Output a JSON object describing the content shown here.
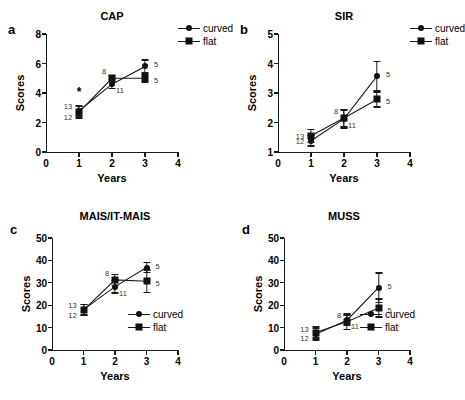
{
  "figure": {
    "legend": {
      "curved": "curved",
      "flat": "flat"
    },
    "axis": {
      "xlabel": "Years",
      "ylabel": "Scores"
    }
  },
  "chart_data": [
    {
      "type": "line",
      "panel": "a",
      "title": "CAP",
      "xlabel": "Years",
      "ylabel": "Scores",
      "x": [
        1,
        2,
        3
      ],
      "xlim": [
        0,
        4
      ],
      "xticks": [
        0,
        1,
        2,
        3,
        4
      ],
      "ylim": [
        0,
        8
      ],
      "yticks": [
        0,
        2,
        4,
        6,
        8
      ],
      "grid": false,
      "legend_position": "top-right-outside",
      "series": [
        {
          "name": "curved",
          "marker": "circle",
          "values": [
            2.8,
            4.6,
            5.8
          ],
          "errors": [
            0.35,
            0.3,
            0.45
          ],
          "n": [
            13,
            11,
            5
          ]
        },
        {
          "name": "flat",
          "marker": "square",
          "values": [
            2.7,
            5.0,
            5.0
          ],
          "errors": [
            0.4,
            0.2,
            0.25
          ],
          "n": [
            12,
            8,
            5
          ]
        }
      ],
      "annotations": [
        {
          "text": "*",
          "x": 1,
          "y": 4.1
        }
      ]
    },
    {
      "type": "line",
      "panel": "b",
      "title": "SIR",
      "xlabel": "Years",
      "ylabel": "Scores",
      "x": [
        1,
        2,
        3
      ],
      "xlim": [
        0,
        4
      ],
      "xticks": [
        0,
        1,
        2,
        3,
        4
      ],
      "ylim": [
        1,
        5
      ],
      "yticks": [
        1,
        2,
        3,
        4,
        5
      ],
      "grid": false,
      "legend_position": "top-right-outside",
      "series": [
        {
          "name": "curved",
          "marker": "circle",
          "values": [
            1.38,
            2.12,
            3.57
          ],
          "errors": [
            0.18,
            0.3,
            0.5
          ],
          "n": [
            13,
            11,
            5
          ]
        },
        {
          "name": "flat",
          "marker": "square",
          "values": [
            1.55,
            2.15,
            2.78
          ],
          "errors": [
            0.22,
            0.3,
            0.25
          ],
          "n": [
            12,
            8,
            5
          ]
        }
      ],
      "annotations": []
    },
    {
      "type": "line",
      "panel": "c",
      "title": "MAIS/IT-MAIS",
      "xlabel": "Years",
      "ylabel": "Scores",
      "x": [
        1,
        2,
        3
      ],
      "xlim": [
        0,
        4
      ],
      "xticks": [
        0,
        1,
        2,
        3,
        4
      ],
      "ylim": [
        0,
        50
      ],
      "yticks": [
        0,
        10,
        20,
        30,
        40,
        50
      ],
      "grid": false,
      "legend_position": "inside-bottom-right",
      "series": [
        {
          "name": "curved",
          "marker": "circle",
          "values": [
            18.0,
            28.3,
            36.8
          ],
          "errors": [
            2.3,
            2.8,
            2.2
          ],
          "n": [
            13,
            11,
            5
          ]
        },
        {
          "name": "flat",
          "marker": "square",
          "values": [
            17.8,
            31.3,
            30.7
          ],
          "errors": [
            2.5,
            2.5,
            5.0
          ],
          "n": [
            12,
            8,
            5
          ]
        }
      ],
      "annotations": []
    },
    {
      "type": "line",
      "panel": "d",
      "title": "MUSS",
      "xlabel": "Years",
      "ylabel": "Scores",
      "x": [
        1,
        2,
        3
      ],
      "xlim": [
        0,
        4
      ],
      "xticks": [
        0,
        1,
        2,
        3,
        4
      ],
      "ylim": [
        0,
        50
      ],
      "yticks": [
        0,
        10,
        20,
        30,
        40,
        50
      ],
      "grid": false,
      "legend_position": "inside-bottom-right",
      "series": [
        {
          "name": "curved",
          "marker": "circle",
          "values": [
            7.0,
            13.3,
            27.8
          ],
          "errors": [
            2.5,
            2.3,
            6.5
          ],
          "n": [
            13,
            11,
            5
          ]
        },
        {
          "name": "flat",
          "marker": "square",
          "values": [
            7.8,
            12.6,
            18.7
          ],
          "errors": [
            2.5,
            3.5,
            4.0
          ],
          "n": [
            12,
            8,
            5
          ]
        }
      ],
      "annotations": []
    }
  ]
}
